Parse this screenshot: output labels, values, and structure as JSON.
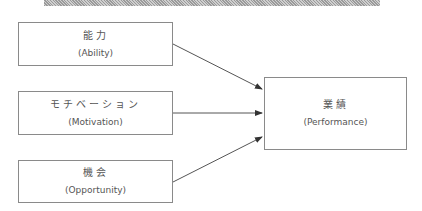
{
  "diagram": {
    "type": "flow",
    "inputs": [
      {
        "jp": "能力",
        "en": "(Ability)"
      },
      {
        "jp": "モチベーション",
        "en": "(Motivation)"
      },
      {
        "jp": "機会",
        "en": "(Opportunity)"
      }
    ],
    "output": {
      "jp": "業績",
      "en": "(Performance)"
    },
    "edges": [
      {
        "from": "能力",
        "to": "業績"
      },
      {
        "from": "モチベーション",
        "to": "業績"
      },
      {
        "from": "機会",
        "to": "業績"
      }
    ]
  },
  "colors": {
    "border": "#8a8a8a",
    "arrow": "#555555",
    "text": "#555555"
  }
}
